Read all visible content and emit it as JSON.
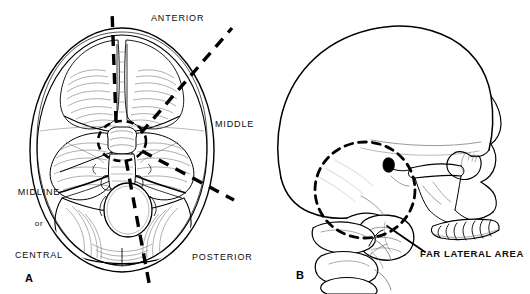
{
  "figure": {
    "panels": [
      {
        "id": "A",
        "letter": "A",
        "caption_labels": {
          "anterior": "ANTERIOR",
          "middle": "MIDDLE",
          "posterior": "POSTERIOR",
          "midline_line1": "MIDLINE",
          "midline_line2": "or",
          "midline_line3": "CENTRAL"
        }
      },
      {
        "id": "B",
        "letter": "B",
        "caption_labels": {
          "far_lateral": "FAR LATERAL AREA"
        }
      }
    ]
  },
  "colors": {
    "background": "#ffffff",
    "ink": "#000000",
    "text": "#0d0d0d",
    "shading": "#6e6e6e",
    "light_shading": "#9a9a9a"
  }
}
